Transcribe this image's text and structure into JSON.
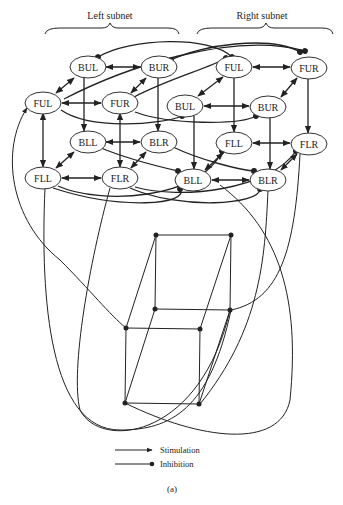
{
  "figure": {
    "caption": "(a)",
    "subnet_labels": {
      "left": "Left subnet",
      "right": "Right subnet"
    },
    "legend": {
      "stimulation": "Stimulation",
      "inhibition": "Inhibition"
    },
    "left_subnet_nodes": [
      {
        "id": "L-BUL",
        "label": "BUL",
        "x": 88,
        "y": 67
      },
      {
        "id": "L-BUR",
        "label": "BUR",
        "x": 159,
        "y": 67
      },
      {
        "id": "L-FUL",
        "label": "FUL",
        "x": 43,
        "y": 103
      },
      {
        "id": "L-FUR",
        "label": "FUR",
        "x": 120,
        "y": 103
      },
      {
        "id": "L-BLL",
        "label": "BLL",
        "x": 88,
        "y": 142
      },
      {
        "id": "L-BLR",
        "label": "BLR",
        "x": 159,
        "y": 142
      },
      {
        "id": "L-FLL",
        "label": "FLL",
        "x": 43,
        "y": 178
      },
      {
        "id": "L-FLR",
        "label": "FLR",
        "x": 120,
        "y": 178
      }
    ],
    "right_subnet_nodes": [
      {
        "id": "R-FUL",
        "label": "FUL",
        "x": 234,
        "y": 67
      },
      {
        "id": "R-FUR",
        "label": "FUR",
        "x": 309,
        "y": 68
      },
      {
        "id": "R-BUL",
        "label": "BUL",
        "x": 185,
        "y": 106
      },
      {
        "id": "R-BUR",
        "label": "BUR",
        "x": 268,
        "y": 107
      },
      {
        "id": "R-FLL",
        "label": "FLL",
        "x": 234,
        "y": 143
      },
      {
        "id": "R-FLR",
        "label": "FLR",
        "x": 309,
        "y": 144
      },
      {
        "id": "R-BLL",
        "label": "BLL",
        "x": 193,
        "y": 180
      },
      {
        "id": "R-BLR",
        "label": "BLR",
        "x": 268,
        "y": 180
      }
    ],
    "cube_vertices": [
      {
        "x": 156,
        "y": 235
      },
      {
        "x": 231,
        "y": 235
      },
      {
        "x": 155,
        "y": 309
      },
      {
        "x": 230,
        "y": 310
      },
      {
        "x": 126,
        "y": 328
      },
      {
        "x": 200,
        "y": 329
      },
      {
        "x": 125,
        "y": 403
      },
      {
        "x": 199,
        "y": 404
      }
    ]
  }
}
